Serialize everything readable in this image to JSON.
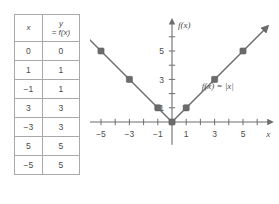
{
  "table": {
    "headers": {
      "x": "x",
      "y_line1": "y",
      "y_line2": "= f(x)"
    },
    "rows": [
      {
        "x": "0",
        "y": "0"
      },
      {
        "x": "1",
        "y": "1"
      },
      {
        "x": "−1",
        "y": "1"
      },
      {
        "x": "3",
        "y": "3"
      },
      {
        "x": "−3",
        "y": "3"
      },
      {
        "x": "5",
        "y": "5"
      },
      {
        "x": "−5",
        "y": "5"
      }
    ]
  },
  "chart_data": {
    "type": "line",
    "title": "",
    "equation_label": "f(x) = |x|",
    "xlabel": "x",
    "ylabel": "f(x)",
    "xlim": [
      -6.5,
      6.5
    ],
    "ylim": [
      -1.6,
      6.8
    ],
    "grid": false,
    "x_ticks": [
      -6,
      -5,
      -4,
      -3,
      -2,
      -1,
      1,
      2,
      3,
      4,
      5,
      6
    ],
    "x_tick_labels": [
      {
        "value": -5,
        "label": "−5"
      },
      {
        "value": -3,
        "label": "−3"
      },
      {
        "value": -1,
        "label": "−1"
      },
      {
        "value": 1,
        "label": "1"
      },
      {
        "value": 3,
        "label": "3"
      },
      {
        "value": 5,
        "label": "5"
      }
    ],
    "y_ticks": [
      1,
      2,
      3,
      4,
      5,
      6
    ],
    "y_tick_labels": [
      {
        "value": 1,
        "label": "1"
      },
      {
        "value": 3,
        "label": "3"
      },
      {
        "value": 5,
        "label": "5"
      }
    ],
    "series": [
      {
        "name": "f(x) = |x|",
        "color": "#6b6b6b",
        "x": [
          -6.5,
          0,
          6.5
        ],
        "y": [
          6.5,
          0,
          6.5
        ],
        "marker_points": [
          {
            "x": -5,
            "y": 5
          },
          {
            "x": -3,
            "y": 3
          },
          {
            "x": -1,
            "y": 1
          },
          {
            "x": 0,
            "y": 0
          },
          {
            "x": 1,
            "y": 1
          },
          {
            "x": 3,
            "y": 3
          },
          {
            "x": 5,
            "y": 5
          }
        ],
        "arrow_ends": [
          "right"
        ]
      }
    ]
  },
  "colors": {
    "curve": "#6b6b6b",
    "axis": "#6e6e6e",
    "text": "#4a4a4a",
    "table_border": "#a9a9a9"
  }
}
